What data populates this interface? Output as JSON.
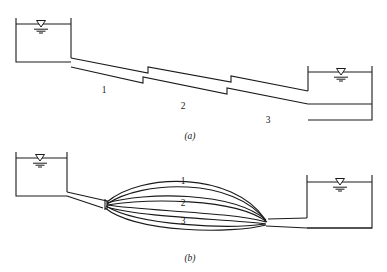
{
  "figure": {
    "background_color": "#ffffff",
    "line_color": "#1a1a1a"
  },
  "panels": [
    {
      "id": "a",
      "caption": "(a)",
      "caption_x": 190,
      "caption_y": 139,
      "configuration": "series",
      "description": "Three pipes in series connecting an upper reservoir to a lower reservoir, with step changes in diameter between sections.",
      "reservoirs": [
        {
          "name": "upper-reservoir",
          "side": "left",
          "left": 16,
          "right": 71,
          "top": 18,
          "bottom": 62,
          "water_surface_y": 24,
          "water_symbol_x": 41
        },
        {
          "name": "lower-reservoir",
          "side": "right",
          "left": 308,
          "right": 372,
          "top": 66,
          "bottom": 120,
          "water_surface_y": 72,
          "water_symbol_x": 341
        }
      ],
      "pipes": [
        {
          "label": "1",
          "label_x": 104,
          "label_y": 93
        },
        {
          "label": "2",
          "label_x": 183,
          "label_y": 109
        },
        {
          "label": "3",
          "label_x": 268,
          "label_y": 123
        }
      ],
      "geometry": {
        "top_wall": "M 71,58 L 148,73 L 148,67 L 231,82 L 231,76 L 308,91",
        "bottom_wall": "M 71,67 L 143,83 L 143,77 L 227,94 L 227,88 L 308,104"
      }
    },
    {
      "id": "b",
      "caption": "(b)",
      "caption_x": 190,
      "caption_y": 261,
      "configuration": "parallel",
      "description": "Three pipes in parallel between two junction nodes connecting an upper reservoir to a lower reservoir.",
      "reservoirs": [
        {
          "name": "upper-reservoir",
          "side": "left",
          "left": 16,
          "right": 67,
          "top": 152,
          "bottom": 196,
          "water_surface_y": 158,
          "water_symbol_x": 40
        },
        {
          "name": "lower-reservoir",
          "side": "right",
          "left": 307,
          "right": 372,
          "top": 175,
          "bottom": 228,
          "water_surface_y": 182,
          "water_symbol_x": 340
        }
      ],
      "junctions": [
        {
          "name": "left-junction",
          "x": 107,
          "y": 204
        },
        {
          "name": "right-junction",
          "x": 265,
          "y": 223
        }
      ],
      "pipes": [
        {
          "label": "1",
          "label_x": 183,
          "label_y": 184
        },
        {
          "label": "2",
          "label_x": 183,
          "label_y": 206
        },
        {
          "label": "3",
          "label_x": 183,
          "label_y": 224
        }
      ]
    }
  ],
  "water_symbol": {
    "name": "water-surface-level-symbol",
    "parts": [
      "inverted-triangle",
      "hatch-lines"
    ],
    "triangle_width": 9,
    "triangle_height": 7
  }
}
